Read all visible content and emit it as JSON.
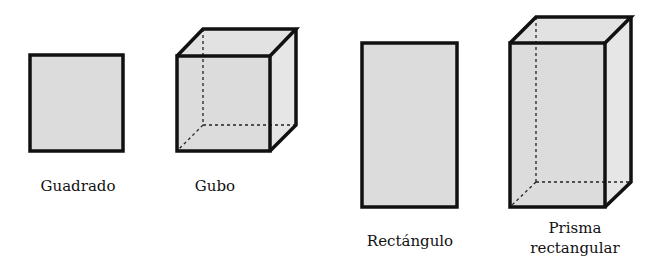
{
  "colors": {
    "fill": "#dcdcdc",
    "side": "#e4e4e4",
    "stroke": "#111111"
  },
  "figures": [
    {
      "name": "square",
      "label": "Guadrado"
    },
    {
      "name": "cube",
      "label": "Gubo"
    },
    {
      "name": "rectangle",
      "label": "Rectángulo"
    },
    {
      "name": "rectangular-prism",
      "label_line1": "Prisma",
      "label_line2": "rectangular"
    }
  ]
}
